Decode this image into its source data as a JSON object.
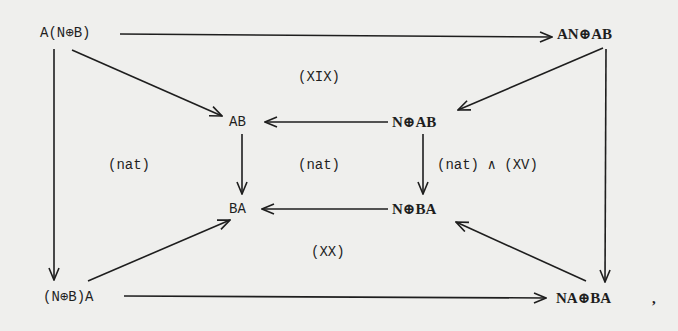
{
  "diagram": {
    "type": "commutative-diagram",
    "nodes": {
      "top_left": "A(N⊕B)",
      "top_right": "AN⊕AB",
      "inner_tl": "AB",
      "inner_tr": "N⊕AB",
      "inner_bl": "BA",
      "inner_br": "N⊕BA",
      "bottom_left": "(N⊕B)A",
      "bottom_right": "NA⊕BA",
      "trailing": ","
    },
    "labels": {
      "top_region": "(XIX)",
      "left_region": "(nat)",
      "center_region": "(nat)",
      "right_region": "(nat) ∧ (XV)",
      "bottom_region": "(XX)"
    },
    "edges": [
      {
        "from": "A(N⊕B)",
        "to": "AN⊕AB"
      },
      {
        "from": "A(N⊕B)",
        "to": "AB"
      },
      {
        "from": "A(N⊕B)",
        "to": "(N⊕B)A"
      },
      {
        "from": "AN⊕AB",
        "to": "N⊕AB"
      },
      {
        "from": "AN⊕AB",
        "to": "NA⊕BA"
      },
      {
        "from": "N⊕AB",
        "to": "AB"
      },
      {
        "from": "N⊕AB",
        "to": "N⊕BA"
      },
      {
        "from": "AB",
        "to": "BA"
      },
      {
        "from": "N⊕BA",
        "to": "BA"
      },
      {
        "from": "(N⊕B)A",
        "to": "BA"
      },
      {
        "from": "(N⊕B)A",
        "to": "NA⊕BA"
      },
      {
        "from": "NA⊕BA",
        "to": "N⊕BA"
      }
    ]
  }
}
